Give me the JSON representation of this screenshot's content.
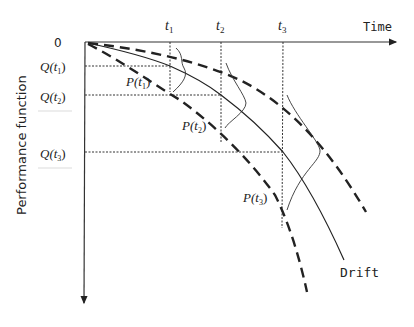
{
  "diagram": {
    "type": "performance drift over time",
    "axes": {
      "x_label": "Time",
      "y_label": "Performance function",
      "origin_label": "0"
    },
    "time_ticks": [
      {
        "label": "t",
        "sub": "1"
      },
      {
        "label": "t",
        "sub": "2"
      },
      {
        "label": "t",
        "sub": "3"
      }
    ],
    "q_levels": [
      {
        "label": "Q(t",
        "sub": "1",
        "close": ")"
      },
      {
        "label": "Q(t",
        "sub": "2",
        "close": ")"
      },
      {
        "label": "Q(t",
        "sub": "3",
        "close": ")"
      }
    ],
    "p_labels": [
      {
        "label": "P(t",
        "sub": "1",
        "close": ")"
      },
      {
        "label": "P(t",
        "sub": "2",
        "close": ")"
      },
      {
        "label": "P(t",
        "sub": "3",
        "close": ")"
      }
    ],
    "curves": {
      "mean_label": "Drift",
      "upper_bound": "dashed",
      "lower_bound": "dashed",
      "mean": "solid"
    },
    "colors": {
      "line": "#222222",
      "background": "#ffffff"
    }
  }
}
